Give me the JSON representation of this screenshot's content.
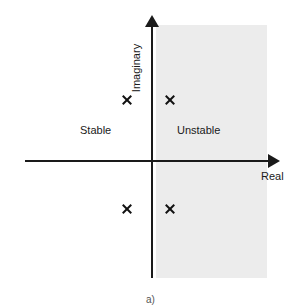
{
  "figure": {
    "caption": "a)",
    "background_color": "#ffffff",
    "axis_color": "#1a1a1a",
    "shaded_region_color": "#ececec",
    "marker_color": "#111111"
  },
  "axes": {
    "x_label": "Real",
    "y_label": "Imaginary",
    "x_arrow_icon": "arrow-right-icon",
    "y_arrow_icon": "arrow-up-icon"
  },
  "regions": [
    {
      "label": "Stable",
      "side": "left-half-plane",
      "shaded": false
    },
    {
      "label": "Unstable",
      "side": "right-half-plane",
      "shaded": true
    }
  ],
  "chart_data": {
    "type": "scatter",
    "title": "",
    "subtitle": "",
    "xlabel": "Real",
    "ylabel": "Imaginary",
    "grid": false,
    "legend": "none",
    "xlim": [
      -1,
      1
    ],
    "ylim": [
      -1,
      1
    ],
    "annotations": [
      "Stable",
      "Unstable",
      "a)"
    ],
    "series": [
      {
        "name": "Poles",
        "marker": "x",
        "points": [
          {
            "x": -0.21,
            "y": 0.5,
            "region": "Stable"
          },
          {
            "x": 0.16,
            "y": 0.5,
            "region": "Unstable"
          },
          {
            "x": -0.21,
            "y": -0.42,
            "region": "Stable"
          },
          {
            "x": 0.16,
            "y": -0.42,
            "region": "Unstable"
          }
        ]
      }
    ]
  },
  "poles": [
    {
      "name": "pole-upper-left",
      "left": 127,
      "top": 100
    },
    {
      "name": "pole-upper-right",
      "left": 170,
      "top": 100
    },
    {
      "name": "pole-lower-left",
      "left": 127,
      "top": 209
    },
    {
      "name": "pole-lower-right",
      "left": 170,
      "top": 209
    }
  ]
}
